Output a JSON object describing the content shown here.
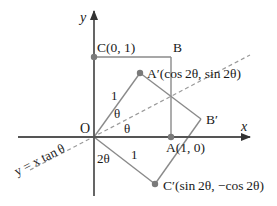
{
  "figure": {
    "type": "reflection-diagram",
    "origin_label": "O",
    "axes": {
      "x_label": "x",
      "y_label": "y"
    },
    "points": {
      "C": "C(0, 1)",
      "B": "B",
      "A_prime": "A′(cos 2θ, sin 2θ)",
      "B_prime": "B′",
      "A": "A(1, 0)",
      "C_prime": "C′(sin 2θ, −cos 2θ)"
    },
    "segment_labels": {
      "OA_prime_length": "1",
      "OC_prime_length": "1"
    },
    "angle_labels": {
      "theta_upper": "θ",
      "theta_lower": "θ",
      "two_theta": "2θ"
    },
    "line_label": "y = x tan θ",
    "colors": {
      "axis": "#555555",
      "line": "#8a8a8a",
      "dash": "#9a9a9a",
      "point": "#7a7a7a",
      "text": "#1a1a1a"
    }
  }
}
